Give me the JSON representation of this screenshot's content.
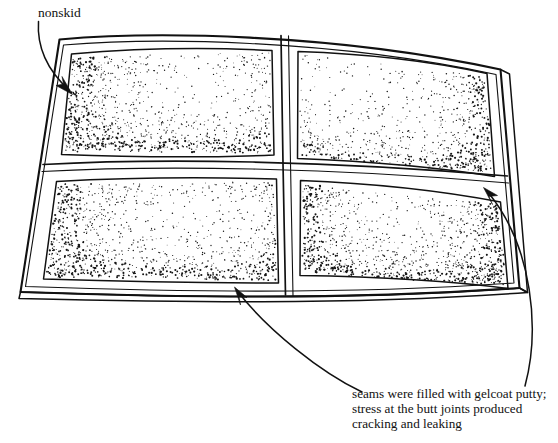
{
  "figure": {
    "panel_count": 4,
    "background_color": "#ffffff",
    "ink_color": "#111111"
  },
  "annotations": [
    {
      "id": "nonskid",
      "label": "nonskid",
      "target": "textured nonskid surface of upper-left panel",
      "label_x": 38,
      "label_y": 17,
      "arrow_tip_x": 70,
      "arrow_tip_y": 93
    },
    {
      "id": "seam-lower",
      "label": "",
      "target": "bottom butt joint seam between lower panels",
      "arrow_tip_x": 235,
      "arrow_tip_y": 287
    },
    {
      "id": "seam-right",
      "label": "",
      "target": "right-side butt joint seam between right panels",
      "arrow_tip_x": 484,
      "arrow_tip_y": 188
    }
  ],
  "caption": {
    "lines": [
      "seams were filled with gelcoat putty;",
      "stress at the butt joints produced",
      "cracking and  leaking"
    ],
    "x": 352,
    "y": 398
  },
  "panels": [
    {
      "id": "upper-left",
      "name": "upper left panel",
      "stipple_edges": [
        "left",
        "bottom"
      ],
      "stipple_density": "heavy"
    },
    {
      "id": "upper-right",
      "name": "upper right panel",
      "stipple_edges": [
        "right",
        "bottom"
      ],
      "stipple_density": "medium"
    },
    {
      "id": "lower-left",
      "name": "lower left panel",
      "stipple_edges": [
        "left",
        "bottom"
      ],
      "stipple_density": "heavy"
    },
    {
      "id": "lower-right",
      "name": "lower right panel",
      "stipple_edges": [
        "left",
        "right",
        "bottom"
      ],
      "stipple_density": "medium"
    }
  ]
}
